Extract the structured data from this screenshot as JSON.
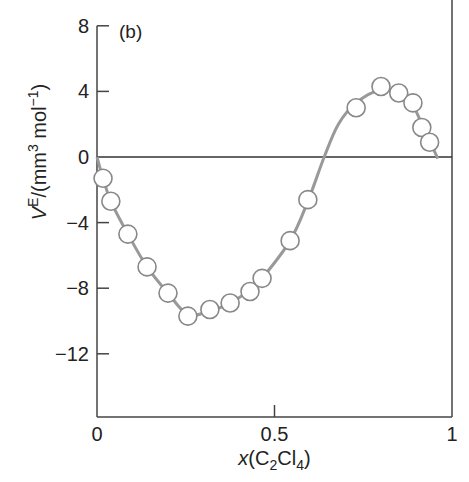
{
  "chart_data": {
    "type": "scatter",
    "panel_label": "(b)",
    "title": "",
    "xlabel": "x(C2Cl4)",
    "xlabel_parts": {
      "italic": "x",
      "open": "(C",
      "sub1": "2",
      "mid": "Cl",
      "sub2": "4",
      "close": ")"
    },
    "ylabel": "V^E/(mm^3 mol^-1)",
    "ylabel_parts": {
      "V": "V",
      "sup1": "E",
      "mid": "/(mm",
      "sup2": "3",
      "mol": " mol",
      "sup3": "−1",
      "close": ")"
    },
    "xlim": [
      0,
      1
    ],
    "ylim": [
      -15,
      8
    ],
    "x_ticks": [
      {
        "value": 0,
        "label": "0"
      },
      {
        "value": 0.5,
        "label": "0.5"
      },
      {
        "value": 1,
        "label": "1"
      }
    ],
    "y_ticks": [
      {
        "value": 8,
        "label": "8"
      },
      {
        "value": 4,
        "label": "4"
      },
      {
        "value": 0,
        "label": "0"
      },
      {
        "value": -4,
        "label": "−4"
      },
      {
        "value": -8,
        "label": "−8"
      },
      {
        "value": -12,
        "label": "−12"
      }
    ],
    "zero_line": true,
    "grid": false,
    "series": [
      {
        "name": "experimental",
        "marker": "open-circle",
        "x": [
          0.017,
          0.039,
          0.087,
          0.141,
          0.2,
          0.256,
          0.318,
          0.375,
          0.431,
          0.465,
          0.544,
          0.594,
          0.73,
          0.8,
          0.85,
          0.89,
          0.915,
          0.937
        ],
        "y": [
          -1.3,
          -2.7,
          -4.7,
          -6.7,
          -8.3,
          -9.7,
          -9.3,
          -8.9,
          -8.2,
          -7.4,
          -5.1,
          -2.6,
          3.0,
          4.3,
          3.9,
          3.3,
          1.8,
          0.9
        ]
      },
      {
        "name": "fitted curve",
        "marker": "line",
        "x": [
          0.0,
          0.017,
          0.039,
          0.087,
          0.141,
          0.2,
          0.256,
          0.318,
          0.375,
          0.431,
          0.465,
          0.544,
          0.594,
          0.64,
          0.68,
          0.73,
          0.8,
          0.85,
          0.89,
          0.915,
          0.937,
          0.96
        ],
        "y": [
          0.0,
          -1.3,
          -2.7,
          -4.7,
          -6.7,
          -8.3,
          -9.6,
          -9.4,
          -8.9,
          -8.1,
          -7.4,
          -5.1,
          -2.7,
          0.0,
          2.0,
          3.3,
          4.1,
          3.8,
          3.1,
          2.0,
          1.0,
          -0.1
        ]
      }
    ],
    "colors": {
      "axis": "#444444",
      "curve": "#999999",
      "marker_stroke": "#888888",
      "marker_fill": "#ffffff"
    }
  }
}
